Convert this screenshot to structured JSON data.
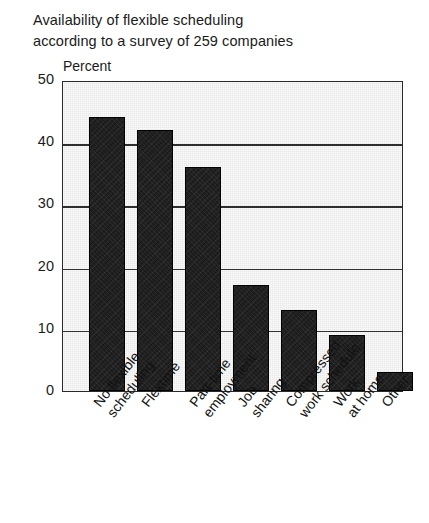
{
  "title": {
    "line1": "Availability of flexible scheduling",
    "line2": "according to a survey of 259 companies"
  },
  "axis": {
    "y_caption": "Percent",
    "y_ticks": [
      "50",
      "40",
      "30",
      "20",
      "10",
      "0"
    ]
  },
  "chart_data": {
    "type": "bar",
    "title": "Availability of flexible scheduling according to a survey of 259 companies",
    "xlabel": "",
    "ylabel": "Percent",
    "ylim": [
      0,
      50
    ],
    "yticks": [
      0,
      10,
      20,
      30,
      40,
      50
    ],
    "grid": true,
    "legend": "none",
    "bar_color": "#1c1c1c",
    "plot_background": "#e8e8e8",
    "categories": [
      "No flexible scheduling",
      "Flextime",
      "Part-time employment",
      "Job sharing",
      "Compressed work schedule",
      "Work at home",
      "Other"
    ],
    "category_lines": [
      [
        "No flexible",
        "scheduling"
      ],
      [
        "Flextime",
        ""
      ],
      [
        "Part-time",
        "employment"
      ],
      [
        "Job",
        "sharing"
      ],
      [
        "Compressed",
        "work schedule"
      ],
      [
        "Work",
        "at home"
      ],
      [
        "Other",
        ""
      ]
    ],
    "values": [
      44,
      42,
      36,
      17,
      13,
      9,
      3
    ]
  }
}
